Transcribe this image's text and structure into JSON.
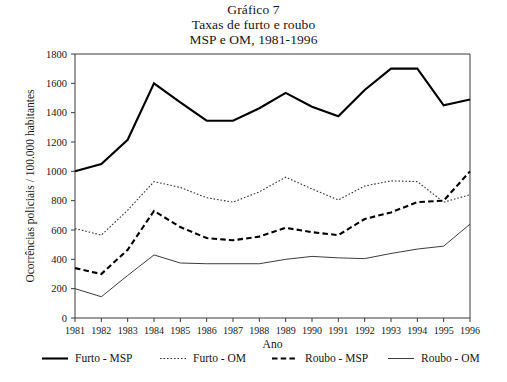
{
  "figure": {
    "title_lines": [
      "Gráfico 7",
      "Taxas de furto e roubo",
      "MSP e OM, 1981-1996"
    ],
    "background_color": "#ffffff",
    "axis_color": "#3a3a3a",
    "text_color": "#161616"
  },
  "chart_data": {
    "type": "line",
    "xlabel": "Ano",
    "ylabel": "Ocorrências policiais / 100.000 habitantes",
    "categories": [
      "1981",
      "1982",
      "1983",
      "1984",
      "1985",
      "1986",
      "1987",
      "1988",
      "1989",
      "1990",
      "1991",
      "1992",
      "1993",
      "1994",
      "1995",
      "1996"
    ],
    "x": [
      1981,
      1982,
      1983,
      1984,
      1985,
      1986,
      1987,
      1988,
      1989,
      1990,
      1991,
      1992,
      1993,
      1994,
      1995,
      1996
    ],
    "xlim": [
      1981,
      1996
    ],
    "ylim": [
      0,
      1800
    ],
    "ytick_values": [
      0,
      200,
      400,
      600,
      800,
      1000,
      1200,
      1400,
      1600,
      1800
    ],
    "ytick_labels": [
      "0",
      "200",
      "400",
      "600",
      "800",
      "1000",
      "1200",
      "1400",
      "1600",
      "1800"
    ],
    "grid": false,
    "legend_position": "bottom",
    "series": [
      {
        "name": "Furto - MSP",
        "style": "solid-thick",
        "color": "#000000",
        "values": [
          1000,
          1050,
          1215,
          1600,
          1470,
          1345,
          1345,
          1430,
          1535,
          1440,
          1375,
          1555,
          1700,
          1700,
          1450,
          1490
        ]
      },
      {
        "name": "Furto - OM",
        "style": "dotted",
        "color": "#333333",
        "values": [
          610,
          565,
          735,
          930,
          890,
          820,
          790,
          860,
          960,
          880,
          805,
          900,
          935,
          930,
          790,
          840
        ]
      },
      {
        "name": "Roubo - MSP",
        "style": "dashed",
        "color": "#000000",
        "values": [
          340,
          300,
          465,
          730,
          620,
          545,
          530,
          555,
          615,
          585,
          565,
          675,
          720,
          790,
          800,
          1000
        ]
      },
      {
        "name": "Roubo - OM",
        "style": "solid-thin",
        "color": "#333333",
        "values": [
          200,
          145,
          290,
          430,
          375,
          370,
          370,
          370,
          400,
          420,
          410,
          405,
          440,
          470,
          490,
          640
        ]
      }
    ]
  },
  "legend": {
    "entries": [
      {
        "label": "Furto - MSP",
        "style": "solid-thick"
      },
      {
        "label": "Furto - OM",
        "style": "dotted"
      },
      {
        "label": "Roubo - MSP",
        "style": "dashed"
      },
      {
        "label": "Roubo - OM",
        "style": "solid-thin"
      }
    ]
  }
}
